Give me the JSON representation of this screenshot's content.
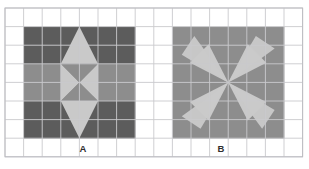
{
  "figure": {
    "title": "",
    "background_color": "#ffffff",
    "grid": {
      "columns": 16,
      "rows": 8,
      "cell_size": 18.6,
      "origin_x": 5,
      "origin_y": 8,
      "line_color": "#c9c9cd",
      "line_width": 0.9,
      "border_color": "#bdbdc2"
    },
    "palette": {
      "dark": "#5c5c5c",
      "medium": "#8d8d8d",
      "light": "#c9c9c9",
      "light_alt": "#bdbdbd",
      "grid_line": "#c9c9cd",
      "label_text": "#2f2f2f"
    },
    "shapes": [
      {
        "id": "A",
        "label": "A",
        "label_x": 83,
        "label_y": 152,
        "grid_col_start": 1,
        "grid_row_start": 1,
        "grid_cols": 6,
        "grid_rows": 6,
        "pattern": "diamond-kite-on-checker-field",
        "field": [
          [
            "dark",
            "dark",
            "dark",
            "dark",
            "dark",
            "dark"
          ],
          [
            "dark",
            "dark",
            "dark",
            "dark",
            "dark",
            "dark"
          ],
          [
            "medium",
            "medium",
            "medium",
            "medium",
            "medium",
            "medium"
          ],
          [
            "medium",
            "medium",
            "medium",
            "medium",
            "medium",
            "medium"
          ],
          [
            "dark",
            "dark",
            "dark",
            "dark",
            "dark",
            "dark"
          ],
          [
            "dark",
            "dark",
            "dark",
            "dark",
            "dark",
            "dark"
          ]
        ],
        "overlay": "light vertical kite: tall triangle top, bowtie middle, tall triangle bottom, centered on columns 3-4"
      },
      {
        "id": "B",
        "label": "B",
        "label_x": 221,
        "label_y": 152,
        "grid_col_start": 9,
        "grid_row_start": 1,
        "grid_cols": 6,
        "grid_rows": 6,
        "pattern": "four-blade-pinwheel-star",
        "field": [
          [
            "medium",
            "medium",
            "medium",
            "medium",
            "medium",
            "medium"
          ],
          [
            "medium",
            "medium",
            "medium",
            "medium",
            "medium",
            "medium"
          ],
          [
            "medium",
            "medium",
            "medium",
            "medium",
            "medium",
            "medium"
          ],
          [
            "medium",
            "medium",
            "medium",
            "medium",
            "medium",
            "medium"
          ],
          [
            "medium",
            "medium",
            "medium",
            "medium",
            "medium",
            "medium"
          ],
          [
            "medium",
            "medium",
            "medium",
            "medium",
            "medium",
            "medium"
          ]
        ],
        "overlay": "light four-pointed pinwheel star rotating about the block centre"
      }
    ],
    "labels": [
      "A",
      "B"
    ]
  }
}
